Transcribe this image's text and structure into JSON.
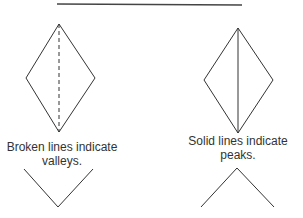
{
  "diagram": {
    "left": {
      "caption_line1": "Broken lines indicate",
      "caption_line2": "valleys.",
      "fold_type": "valley",
      "line_style": "dashed"
    },
    "right": {
      "caption_line1": "Solid lines indicate",
      "caption_line2": "peaks.",
      "fold_type": "peak",
      "line_style": "solid"
    },
    "colors": {
      "line": "#333333",
      "background": "#ffffff"
    }
  }
}
